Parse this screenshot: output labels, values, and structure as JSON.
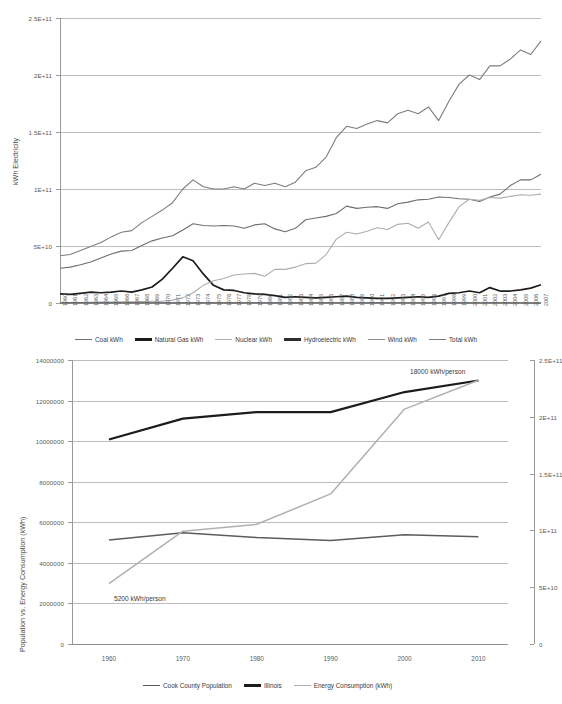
{
  "chart_data": [
    {
      "id": "electricity-by-source",
      "type": "line",
      "title": "",
      "xlabel": "",
      "ylabel": "kWh Electricity",
      "ylim": [
        0,
        250000000000
      ],
      "yticks": [
        "0",
        "5E+10",
        "1E+11",
        "1.5E+11",
        "2E+11",
        "2.5E+11"
      ],
      "ytick_values": [
        0,
        50000000000,
        100000000000,
        150000000000,
        200000000000,
        250000000000
      ],
      "grid": true,
      "legend_position": "bottom",
      "categories": [
        "1960",
        "1961",
        "1962",
        "1963",
        "1964",
        "1965",
        "1966",
        "1967",
        "1968",
        "1969",
        "1970",
        "1971",
        "1972",
        "1973",
        "1974",
        "1975",
        "1976",
        "1977",
        "1978",
        "1979",
        "1980",
        "1981",
        "1982",
        "1983",
        "1984",
        "1985",
        "1986",
        "1987",
        "1988",
        "1989",
        "1990",
        "1991",
        "1992",
        "1993",
        "1994",
        "1995",
        "1996",
        "1997",
        "1998",
        "1999",
        "2000",
        "2001",
        "2002",
        "2003",
        "2004",
        "2005",
        "2006",
        "2007"
      ],
      "series": [
        {
          "name": "Coal kWh",
          "color": "#6e6e6e",
          "values": [
            30500000000.0,
            31500000000.0,
            33500000000.0,
            36000000000.0,
            39500000000.0,
            43000000000.0,
            45500000000.0,
            46000000000.0,
            50500000000.0,
            54500000000.0,
            57000000000.0,
            59000000000.0,
            64000000000.0,
            69500000000.0,
            68000000000.0,
            67500000000.0,
            68000000000.0,
            67500000000.0,
            65500000000.0,
            68500000000.0,
            69500000000.0,
            65000000000.0,
            62500000000.0,
            65500000000.0,
            73000000000.0,
            74500000000.0,
            76000000000.0,
            78500000000.0,
            85000000000.0,
            83000000000.0,
            84000000000.0,
            84500000000.0,
            83000000000.0,
            87000000000.0,
            88500000000.0,
            90500000000.0,
            91000000000.0,
            93000000000.0,
            92500000000.0,
            91500000000.0,
            91000000000.0,
            89000000000.0,
            93000000000.0,
            95500000000.0,
            103000000000.0,
            108000000000.0,
            108000000000.0,
            113000000000.0
          ]
        },
        {
          "name": "Natural Gas kWh",
          "color": "#1c1c1c",
          "values": [
            8000000000.0,
            7500000000.0,
            8500000000.0,
            9500000000.0,
            9000000000.0,
            9500000000.0,
            10500000000.0,
            9500000000.0,
            11500000000.0,
            14000000000.0,
            21000000000.0,
            30500000000.0,
            40500000000.0,
            37000000000.0,
            25500000000.0,
            15500000000.0,
            11500000000.0,
            11000000000.0,
            9000000000.0,
            8000000000.0,
            7500000000.0,
            6500000000.0,
            5000000000.0,
            5500000000.0,
            5000000000.0,
            4500000000.0,
            5000000000.0,
            5500000000.0,
            6000000000.0,
            5000000000.0,
            4500000000.0,
            4000000000.0,
            4000000000.0,
            4500000000.0,
            5000000000.0,
            5500000000.0,
            5000000000.0,
            6000000000.0,
            8500000000.0,
            9000000000.0,
            10500000000.0,
            9000000000.0,
            13500000000.0,
            10500000000.0,
            10500000000.0,
            11500000000.0,
            13000000000.0,
            16000000000.0
          ]
        },
        {
          "name": "Nuclear kWh",
          "color": "#adadad",
          "values": [
            200000000.0,
            250000000.0,
            500000000.0,
            600000000.0,
            800000000.0,
            900000000.0,
            1000000000.0,
            1100000000.0,
            1300000000.0,
            1500000000.0,
            1600000000.0,
            2500000000.0,
            4500000000.0,
            9000000000.0,
            15500000000.0,
            19500000000.0,
            21500000000.0,
            24500000000.0,
            25500000000.0,
            26000000000.0,
            23500000000.0,
            29500000000.0,
            29500000000.0,
            31500000000.0,
            34500000000.0,
            35000000000.0,
            42500000000.0,
            56000000000.0,
            62000000000.0,
            60500000000.0,
            63000000000.0,
            66000000000.0,
            64500000000.0,
            69000000000.0,
            70000000000.0,
            65500000000.0,
            71000000000.0,
            55500000000.0,
            70500000000.0,
            84500000000.0,
            91000000000.0,
            90000000000.0,
            92500000000.0,
            92000000000.0,
            93500000000.0,
            95000000000.0,
            94500000000.0,
            95500000000.0
          ]
        },
        {
          "name": "Hydroelectric kWh",
          "color": "#2e2e2e",
          "values": [
            200000000.0,
            200000000.0,
            200000000.0,
            200000000.0,
            200000000.0,
            200000000.0,
            200000000.0,
            200000000.0,
            200000000.0,
            200000000.0,
            200000000.0,
            200000000.0,
            200000000.0,
            250000000.0,
            250000000.0,
            250000000.0,
            250000000.0,
            250000000.0,
            250000000.0,
            250000000.0,
            250000000.0,
            250000000.0,
            250000000.0,
            250000000.0,
            250000000.0,
            250000000.0,
            250000000.0,
            250000000.0,
            250000000.0,
            250000000.0,
            250000000.0,
            250000000.0,
            250000000.0,
            250000000.0,
            250000000.0,
            250000000.0,
            250000000.0,
            250000000.0,
            250000000.0,
            250000000.0,
            250000000.0,
            250000000.0,
            250000000.0,
            250000000.0,
            250000000.0,
            250000000.0,
            250000000.0,
            250000000.0
          ]
        },
        {
          "name": "Wind kWh",
          "color": "#8a8a8a",
          "values": [
            0,
            0,
            0,
            0,
            0,
            0,
            0,
            0,
            0,
            0,
            0,
            0,
            0,
            0,
            0,
            0,
            0,
            0,
            0,
            0,
            0,
            0,
            0,
            0,
            0,
            0,
            0,
            0,
            0,
            0,
            0,
            0,
            0,
            0,
            0,
            0,
            0,
            0,
            0,
            0,
            0,
            0,
            0,
            0,
            0,
            0,
            200000000.0,
            500000000.0
          ]
        },
        {
          "name": "Total kWh",
          "color": "#7d7d7d",
          "values": [
            41500000000.0,
            42500000000.0,
            46000000000.0,
            49500000000.0,
            53000000000.0,
            58000000000.0,
            62000000000.0,
            63500000000.0,
            70500000000.0,
            76000000000.0,
            81500000000.0,
            88000000000.0,
            100000000000.0,
            108000000000.0,
            102000000000.0,
            100000000000.0,
            100000000000.0,
            102000000000.0,
            100000000000.0,
            105000000000.0,
            103000000000.0,
            105000000000.0,
            102000000000.0,
            106000000000.0,
            116000000000.0,
            119000000000.0,
            128000000000.0,
            145000000000.0,
            155000000000.0,
            153000000000.0,
            157000000000.0,
            160000000000.0,
            158000000000.0,
            166000000000.0,
            169000000000.0,
            166000000000.0,
            172000000000.0,
            160000000000.0,
            177000000000.0,
            192000000000.0,
            200000000000.0,
            196000000000.0,
            208000000000.0,
            208000000000.0,
            214000000000.0,
            222000000000.0,
            218000000000.0,
            230000000000.0
          ]
        }
      ]
    },
    {
      "id": "population-vs-energy",
      "type": "line",
      "title": "",
      "xlabel": "",
      "ylabel": "Population vs. Energy Consumption (kWh)",
      "ylim": [
        0,
        14000000
      ],
      "yticks": [
        "0",
        "2000000",
        "4000000",
        "6000000",
        "8000000",
        "10000000",
        "12000000",
        "14000000"
      ],
      "ytick_values": [
        0,
        2000000,
        4000000,
        6000000,
        8000000,
        10000000,
        12000000,
        14000000
      ],
      "y2label": "",
      "y2lim": [
        0,
        250000000000
      ],
      "y2ticks": [
        "0",
        "5E+10",
        "1E+11",
        "1.5E+11",
        "2E+11",
        "2.5E+11"
      ],
      "y2tick_values": [
        0,
        50000000000,
        100000000000,
        150000000000,
        200000000000,
        250000000000
      ],
      "grid": true,
      "legend_position": "bottom",
      "x": [
        1960,
        1970,
        1980,
        1990,
        2000,
        2010
      ],
      "xticks": [
        "1960",
        "1970",
        "1980",
        "1990",
        "2000",
        "2010"
      ],
      "series": [
        {
          "name": "Cook County Population",
          "color": "#5c5c5c",
          "axis": "left",
          "values": [
            5130000,
            5490000,
            5250000,
            5100000,
            5380000,
            5290000
          ]
        },
        {
          "name": "Illinois",
          "color": "#1c1c1c",
          "axis": "left",
          "values": [
            10080000,
            11110000,
            11430000,
            11430000,
            12420000,
            12990000
          ]
        },
        {
          "name": "Energy Consumption (kWh)",
          "color": "#b0b0b0",
          "axis": "right",
          "values": [
            2980000,
            5560000,
            5900000,
            7400000,
            11580000,
            13000000
          ]
        }
      ],
      "annotations": [
        {
          "text": "18000 kWh/person",
          "x": 410,
          "y": 368
        },
        {
          "text": "5200 kWh/person",
          "x": 114,
          "y": 595
        }
      ]
    }
  ]
}
